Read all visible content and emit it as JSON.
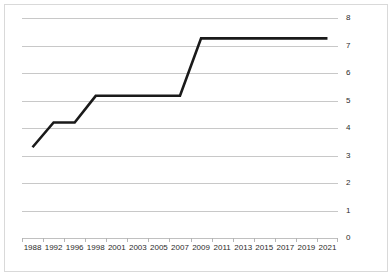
{
  "chart_data": {
    "type": "line",
    "title": "",
    "xlabel": "",
    "ylabel": "",
    "ylim": [
      0,
      8
    ],
    "ytick_step": 1,
    "grid": true,
    "legend": false,
    "legend_position": "none",
    "line_color": "#1a1a1a",
    "gridline_color": "#c8c8c8",
    "border_color": "#d9d9d9",
    "categories": [
      "1988",
      "1992",
      "1996",
      "1998",
      "2001",
      "2003",
      "2005",
      "2007",
      "2009",
      "2011",
      "2013",
      "2015",
      "2017",
      "2019",
      "2021"
    ],
    "yticks": [
      "0",
      "1",
      "2",
      "3",
      "4",
      "5",
      "6",
      "7",
      "8"
    ],
    "series": [
      {
        "name": "value",
        "values": [
          3.3,
          4.2,
          4.2,
          5.17,
          5.17,
          5.17,
          5.17,
          5.17,
          7.26,
          7.26,
          7.26,
          7.26,
          7.26,
          7.26,
          7.26
        ]
      }
    ],
    "points": [
      {
        "x": "1988",
        "y": 3.3
      },
      {
        "x": "1992",
        "y": 4.2
      },
      {
        "x": "1996",
        "y": 4.2
      },
      {
        "x": "1998",
        "y": 5.17
      },
      {
        "x": "2001",
        "y": 5.17
      },
      {
        "x": "2003",
        "y": 5.17
      },
      {
        "x": "2005",
        "y": 5.17
      },
      {
        "x": "2007",
        "y": 5.17
      },
      {
        "x": "2009",
        "y": 7.26
      },
      {
        "x": "2011",
        "y": 7.26
      },
      {
        "x": "2013",
        "y": 7.26
      },
      {
        "x": "2015",
        "y": 7.26
      },
      {
        "x": "2017",
        "y": 7.26
      },
      {
        "x": "2019",
        "y": 7.26
      },
      {
        "x": "2021",
        "y": 7.26
      }
    ]
  }
}
